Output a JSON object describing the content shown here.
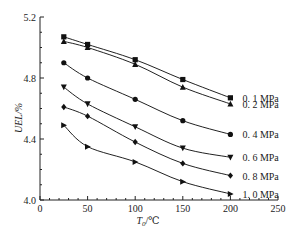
{
  "chart_data": {
    "type": "line",
    "title": "",
    "xlabel": "T0/℃",
    "ylabel": "UEL/%",
    "xlim": [
      0,
      250
    ],
    "ylim": [
      4.0,
      5.2
    ],
    "x_ticks": [
      0,
      50,
      100,
      150,
      200,
      250
    ],
    "y_ticks": [
      4.0,
      4.4,
      4.8,
      5.2
    ],
    "x_tick_labels": [
      "0",
      "50",
      "100",
      "150",
      "200",
      "250"
    ],
    "y_tick_labels": [
      "4.0",
      "4.4",
      "4.8",
      "5.2"
    ],
    "grid": false,
    "legend_position": "inline-right",
    "x": [
      25,
      50,
      100,
      150,
      200
    ],
    "series": [
      {
        "name": "0.1 MPa",
        "label": "0. 1 MPa",
        "marker": "square",
        "values": [
          5.07,
          5.02,
          4.92,
          4.79,
          4.67
        ]
      },
      {
        "name": "0.2 MPa",
        "label": "0. 2 MPa",
        "marker": "triangle-up",
        "values": [
          5.04,
          5.0,
          4.89,
          4.74,
          4.63
        ]
      },
      {
        "name": "0.4 MPa",
        "label": "0. 4 MPa",
        "marker": "circle",
        "values": [
          4.9,
          4.8,
          4.66,
          4.52,
          4.43
        ]
      },
      {
        "name": "0.6 MPa",
        "label": "0. 6 MPa",
        "marker": "triangle-down",
        "values": [
          4.74,
          4.63,
          4.48,
          4.34,
          4.28
        ]
      },
      {
        "name": "0.8 MPa",
        "label": "0. 8 MPa",
        "marker": "diamond",
        "values": [
          4.61,
          4.55,
          4.38,
          4.24,
          4.16
        ]
      },
      {
        "name": "1.0 MPa",
        "label": "1. 0 MPa",
        "marker": "triangle-right",
        "values": [
          4.49,
          4.35,
          4.25,
          4.12,
          4.04
        ]
      }
    ]
  },
  "labels": {
    "ylabel": "UEL/%",
    "xlabel_main": "T",
    "xlabel_sub": "0",
    "xlabel_unit": "/℃"
  }
}
